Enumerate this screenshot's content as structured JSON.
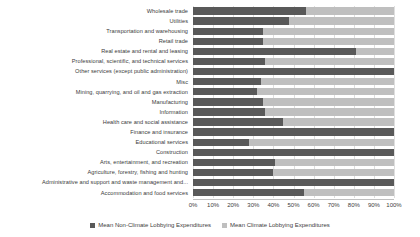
{
  "chart_data": {
    "type": "bar",
    "subtype": "stacked-horizontal-100pct",
    "title": "",
    "xlabel": "",
    "ylabel": "",
    "xlim": [
      0,
      100
    ],
    "xticks": [
      "0%",
      "10%",
      "20%",
      "30%",
      "40%",
      "50%",
      "60%",
      "70%",
      "80%",
      "90%",
      "100%"
    ],
    "grid": true,
    "legend_position": "bottom",
    "categories": [
      "Wholesale trade",
      "Utilities",
      "Transportation and warehousing",
      "Retail trade",
      "Real estate and rental and leasing",
      "Professional, scientific, and technical services",
      "Other services (except public administration)",
      "Misc",
      "Mining, quarrying, and oil and gas extraction",
      "Manufacturing",
      "Information",
      "Health care and social assistance",
      "Finance and insurance",
      "Educational services",
      "Construction",
      "Arts, entertainment, and recreation",
      "Agriculture, forestry, fishing and hunting",
      "Administrative and support and waste management and...",
      "Accommodation and food services"
    ],
    "series": [
      {
        "name": "Mean Non-Climate Lobbying Expenditures",
        "color": "#595959",
        "values": [
          56,
          48,
          35,
          35,
          81,
          36,
          100,
          34,
          32,
          35,
          36,
          45,
          100,
          28,
          100,
          41,
          40,
          100,
          55
        ]
      },
      {
        "name": "Mean Climate Lobbying Expenditures",
        "color": "#bfbfbf",
        "values": [
          44,
          52,
          65,
          65,
          19,
          64,
          0,
          66,
          68,
          65,
          64,
          55,
          0,
          72,
          0,
          59,
          60,
          0,
          45
        ]
      }
    ]
  },
  "legend": {
    "items": [
      {
        "label": "Mean Non-Climate Lobbying Expenditures",
        "color": "#595959"
      },
      {
        "label": "Mean Climate Lobbying Expenditures",
        "color": "#bfbfbf"
      }
    ]
  },
  "colors": {
    "series_non_climate": "#595959",
    "series_climate": "#bfbfbf",
    "gridline": "#d9d9d9",
    "axis": "#bfbfbf",
    "text": "#404040",
    "background": "#ffffff"
  }
}
